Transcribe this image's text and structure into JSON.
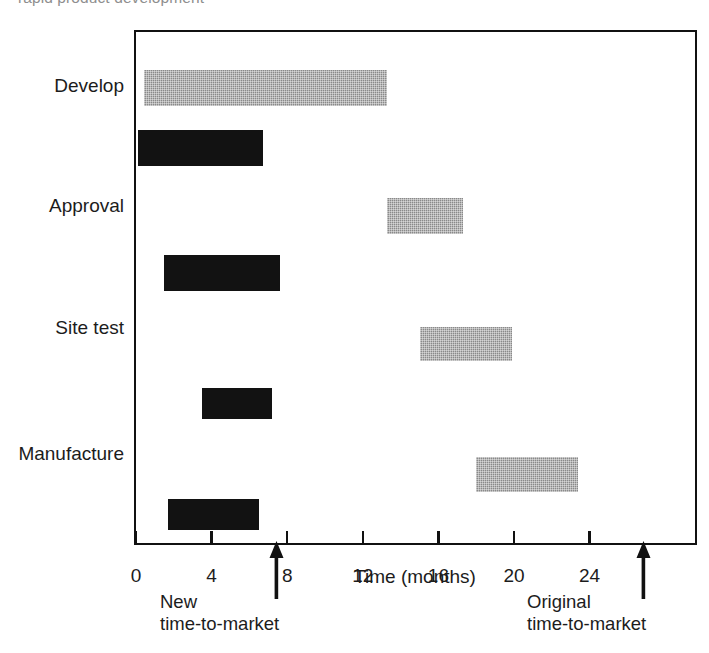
{
  "top_caption": "rapid product development",
  "chart_data": {
    "type": "bar",
    "subtype": "gantt",
    "title": "",
    "xlabel": "Time (months)",
    "ylabel": "",
    "xlim": [
      0,
      29.7
    ],
    "ylim": [
      0,
      4
    ],
    "grid": false,
    "legend": "none",
    "x_ticks": [
      0,
      4,
      8,
      12,
      16,
      20,
      24
    ],
    "x_tick_labels": [
      "0",
      "4",
      "8",
      "12",
      "16",
      "20",
      "24"
    ],
    "categories": [
      "Develop",
      "Approval",
      "Site test",
      "Manufacture"
    ],
    "series": [
      {
        "name": "Original schedule",
        "color": "#8a8a8a",
        "style": "gray-hatched",
        "bars": [
          {
            "category": "Develop",
            "start": 0.3,
            "end": 13.2,
            "duration": 12.9
          },
          {
            "category": "Approval",
            "start": 13.2,
            "end": 17.2,
            "duration": 4.0
          },
          {
            "category": "Site test",
            "start": 14.9,
            "end": 19.8,
            "duration": 4.9
          },
          {
            "category": "Manufacture",
            "start": 17.9,
            "end": 23.3,
            "duration": 5.4
          }
        ]
      },
      {
        "name": "Compressed schedule",
        "color": "#121212",
        "style": "solid-black",
        "bars": [
          {
            "category": "Develop",
            "start": 0.0,
            "end": 6.6,
            "duration": 6.6
          },
          {
            "category": "Approval",
            "start": 1.4,
            "end": 7.5,
            "duration": 6.1
          },
          {
            "category": "Site test",
            "start": 3.4,
            "end": 7.1,
            "duration": 3.7
          },
          {
            "category": "Manufacture",
            "start": 1.6,
            "end": 6.4,
            "duration": 4.8
          }
        ]
      }
    ],
    "annotations": [
      {
        "id": "new-ttm",
        "month": 7.4,
        "label_line1": "New",
        "label_line2": "time-to-market",
        "marker": "up-arrow"
      },
      {
        "id": "original-ttm",
        "month": 26.8,
        "label_line1": "Original",
        "label_line2": "time-to-market",
        "marker": "up-arrow"
      }
    ]
  },
  "axis": {
    "x_title": "Time (months)"
  }
}
